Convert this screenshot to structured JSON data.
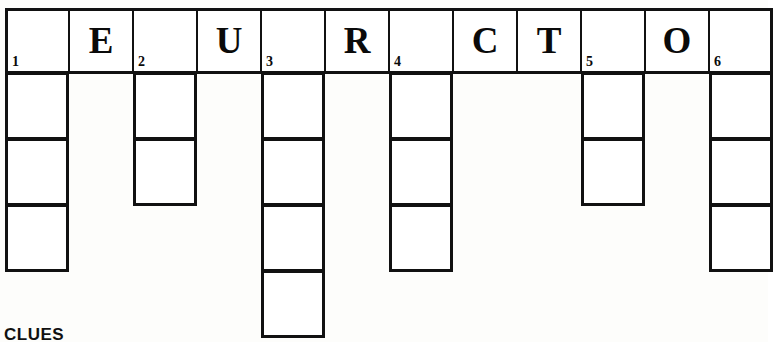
{
  "puzzle": {
    "title": "Crossword Grid",
    "clues_heading": "CLUES",
    "grid": {
      "columns": 12,
      "rows": 5,
      "cell_width": 64,
      "cell_height": 66,
      "origin_x": 5,
      "origin_y": 8
    },
    "top_row_letters": [
      "",
      "E",
      "",
      "U",
      "",
      "R",
      "",
      "C",
      "T",
      "",
      "O",
      ""
    ],
    "entries": [
      {
        "number": "1",
        "column": 0,
        "length": 4,
        "letters": [
          "",
          "",
          "",
          ""
        ]
      },
      {
        "number": "2",
        "column": 2,
        "length": 3,
        "letters": [
          "",
          "",
          ""
        ]
      },
      {
        "number": "3",
        "column": 4,
        "length": 5,
        "letters": [
          "",
          "",
          "",
          "",
          ""
        ]
      },
      {
        "number": "4",
        "column": 6,
        "length": 4,
        "letters": [
          "",
          "",
          "",
          ""
        ]
      },
      {
        "number": "5",
        "column": 9,
        "length": 3,
        "letters": [
          "",
          "",
          ""
        ]
      },
      {
        "number": "6",
        "column": 11,
        "length": 4,
        "letters": [
          "",
          "",
          "",
          ""
        ]
      }
    ],
    "colors": {
      "grid_line": "#111111",
      "cell_fill": "#ffffff",
      "text": "#0a0a0a",
      "page_background": "#fdfdfb"
    }
  }
}
